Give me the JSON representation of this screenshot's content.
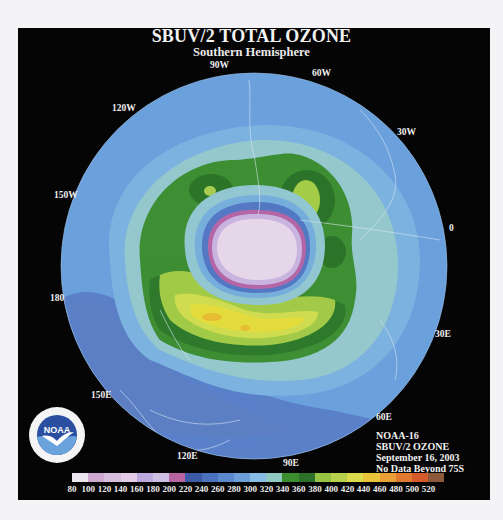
{
  "header": {
    "title": "SBUV/2 TOTAL OZONE",
    "subtitle": "Southern Hemisphere"
  },
  "map": {
    "projection": "south-polar-stereographic",
    "longitude_labels": [
      {
        "text": "90W",
        "x": 210,
        "y": 60
      },
      {
        "text": "60W",
        "x": 312,
        "y": 68
      },
      {
        "text": "120W",
        "x": 112,
        "y": 103
      },
      {
        "text": "30W",
        "x": 397,
        "y": 127
      },
      {
        "text": "150W",
        "x": 54,
        "y": 190
      },
      {
        "text": "0",
        "x": 449,
        "y": 223
      },
      {
        "text": "180",
        "x": 50,
        "y": 293
      },
      {
        "text": "30E",
        "x": 435,
        "y": 329
      },
      {
        "text": "150E",
        "x": 91,
        "y": 390
      },
      {
        "text": "60E",
        "x": 376,
        "y": 412
      },
      {
        "text": "120E",
        "x": 177,
        "y": 451
      },
      {
        "text": "90E",
        "x": 283,
        "y": 458
      }
    ],
    "colors": {
      "ocean_band_low": "#5c84c8",
      "band_300": "#74a8de",
      "band_320": "#92c6d2",
      "band_340": "#3f8e32",
      "band_360": "#2f7a2c",
      "band_380": "#a4cc4a",
      "band_400": "#d0dd52",
      "band_420": "#e6de3c",
      "band_440": "#e6b830",
      "hole_edge_220": "#4a6abf",
      "hole_200": "#b66aa8",
      "hole_180": "#c8b8e0",
      "hole_center": "#e8d8ec"
    }
  },
  "info": {
    "satellite": "NOAA-16",
    "instrument": "SBUV/2 OZONE",
    "date": "September 16, 2003",
    "note": "No Data Beyond 75S"
  },
  "logo": {
    "text": "NOAA",
    "ring_text": "NATIONAL OCEANIC AND ATMOSPHERIC ADMINISTRATION · U.S. DEPARTMENT OF COMMERCE"
  },
  "colorbar": {
    "units": "Dobson Units",
    "colors": [
      "#ece6ee",
      "#cfa8d2",
      "#d8bede",
      "#e2cce6",
      "#bcaade",
      "#cbbfe4",
      "#b8649e",
      "#3c5aa6",
      "#4a70be",
      "#5c88cc",
      "#6e9ed8",
      "#88bce4",
      "#90c8c2",
      "#3c8c30",
      "#2c702a",
      "#98c444",
      "#b8d04c",
      "#dadc4c",
      "#e8c43a",
      "#e8a036",
      "#e07a30",
      "#d45a2c",
      "#8c5a3a"
    ],
    "ticks": [
      "80",
      "100",
      "120",
      "140",
      "160",
      "180",
      "200",
      "220",
      "240",
      "260",
      "280",
      "300",
      "320",
      "340",
      "360",
      "380",
      "400",
      "420",
      "440",
      "460",
      "480",
      "500",
      "520"
    ]
  }
}
